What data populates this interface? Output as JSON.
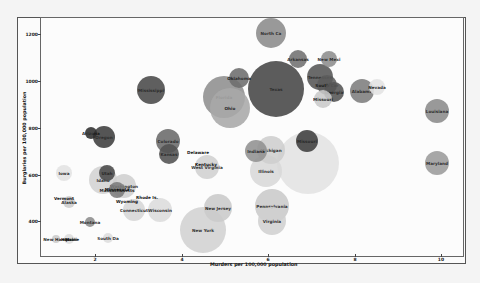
{
  "chart_data": {
    "type": "scatter",
    "subtype": "bubble",
    "title": "",
    "xlabel": "Murders per 100,000 population",
    "ylabel": "Burglaries per 100,000 population",
    "xlim": [
      0.8,
      10.3
    ],
    "ylim": [
      260,
      1300
    ],
    "x_ticks": [
      "2",
      "4",
      "6",
      "8",
      "10"
    ],
    "y_ticks": [
      "400",
      "600",
      "800",
      "1000",
      "1200"
    ],
    "grid": false,
    "legend": "none",
    "points": [
      {
        "label": "North Ca",
        "x": 6.6,
        "y": 1210,
        "r": 15,
        "color": "#8a8a8a"
      },
      {
        "label": "Arkansas",
        "x": 6.6,
        "y": 1095,
        "r": 9,
        "color": "#707070"
      },
      {
        "label": "New Mexi",
        "x": 7.3,
        "y": 1090,
        "r": 8,
        "color": "#8a8a8a"
      },
      {
        "label": "Oklahoma",
        "x": 5.4,
        "y": 1020,
        "r": 10,
        "color": "#6f6f6f"
      },
      {
        "label": "Texas",
        "x": 6.1,
        "y": 1000,
        "r": 27,
        "color": "#3c3c3c"
      },
      {
        "label": "California",
        "x": 6.2,
        "y": 960,
        "r": 0,
        "color": "#3c3c3c"
      },
      {
        "label": "Florida",
        "x": 5.2,
        "y": 955,
        "r": 21,
        "color": "#8f8f8f"
      },
      {
        "label": "Ohio",
        "x": 5.2,
        "y": 900,
        "r": 20,
        "color": "#a8a8a8"
      },
      {
        "label": "Tennessee",
        "x": 7.0,
        "y": 1030,
        "r": 13,
        "color": "#555555"
      },
      {
        "label": "South Car",
        "x": 7.1,
        "y": 1000,
        "r": 11,
        "color": "#5b5b5b"
      },
      {
        "label": "Georgia",
        "x": 7.4,
        "y": 970,
        "r": 10,
        "color": "#555555"
      },
      {
        "label": "Missouri",
        "x": 7.2,
        "y": 940,
        "r": 9,
        "color": "#c8c8c8"
      },
      {
        "label": "Alabama",
        "x": 8.1,
        "y": 960,
        "r": 12,
        "color": "#7c7c7c"
      },
      {
        "label": "Nevada",
        "x": 8.5,
        "y": 970,
        "r": 9,
        "color": "#e0e0e0"
      },
      {
        "label": "Louisiana",
        "x": 9.9,
        "y": 880,
        "r": 12,
        "color": "#8a8a8a"
      },
      {
        "label": "Maryland",
        "x": 9.9,
        "y": 640,
        "r": 12,
        "color": "#9a9a9a"
      },
      {
        "label": "Mississippi",
        "x": 3.3,
        "y": 960,
        "r": 14,
        "color": "#474747"
      },
      {
        "label": "Arizona",
        "x": 1.9,
        "y": 780,
        "r": 6,
        "color": "#2e2e2e"
      },
      {
        "label": "Oregon",
        "x": 2.2,
        "y": 770,
        "r": 11,
        "color": "#3d3d3d"
      },
      {
        "label": "Colorado",
        "x": 3.6,
        "y": 750,
        "r": 12,
        "color": "#6a6a6a"
      },
      {
        "label": "Kansas",
        "x": 3.6,
        "y": 690,
        "r": 10,
        "color": "#4e4e4e"
      },
      {
        "label": "Delaware",
        "x": 4.4,
        "y": 690,
        "r": 0,
        "color": "#cccccc"
      },
      {
        "label": "Kentucky",
        "x": 4.6,
        "y": 630,
        "r": 0,
        "color": "#cccccc"
      },
      {
        "label": "West Virginia",
        "x": 4.5,
        "y": 620,
        "r": 12,
        "color": "#d0d0d0"
      },
      {
        "label": "Indiana",
        "x": 5.7,
        "y": 700,
        "r": 10,
        "color": "#8f8f8f"
      },
      {
        "label": "Michigan",
        "x": 6.1,
        "y": 700,
        "r": 14,
        "color": "#cdcdcd"
      },
      {
        "label": "Illinois",
        "x": 5.9,
        "y": 620,
        "r": 16,
        "color": "#d8d8d8"
      },
      {
        "label": "Pennsylvania",
        "x": 6.0,
        "y": 450,
        "r": 17,
        "color": "#c9c9c9"
      },
      {
        "label": "Virginia",
        "x": 6.0,
        "y": 390,
        "r": 14,
        "color": "#cfcfcf"
      },
      {
        "label": "New Jersey",
        "x": 4.8,
        "y": 460,
        "r": 14,
        "color": "#c9c9c9"
      },
      {
        "label": "New York",
        "x": 4.4,
        "y": 350,
        "r": 22,
        "color": "#cfcfcf"
      },
      {
        "label": "Wisconsin",
        "x": 3.5,
        "y": 470,
        "r": 12,
        "color": "#dcdcdc"
      },
      {
        "label": "Connecticut",
        "x": 3.0,
        "y": 460,
        "r": 11,
        "color": "#d6d6d6"
      },
      {
        "label": "Nebraska",
        "x": 3.1,
        "y": 510,
        "r": 0,
        "color": "#cccccc"
      },
      {
        "label": "Wyoming",
        "x": 2.8,
        "y": 500,
        "r": 0,
        "color": "#cccccc"
      },
      {
        "label": "Washington",
        "x": 2.7,
        "y": 550,
        "r": 12,
        "color": "#cfcfcf"
      },
      {
        "label": "Massachusetts",
        "x": 2.5,
        "y": 555,
        "r": 8,
        "color": "#7a7a7a"
      },
      {
        "label": "Minnesota",
        "x": 2.2,
        "y": 565,
        "r": 0,
        "color": "#d0d0d0"
      },
      {
        "label": "Utah",
        "x": 2.3,
        "y": 610,
        "r": 8,
        "color": "#474747"
      },
      {
        "label": "Idaho",
        "x": 1.9,
        "y": 580,
        "r": 14,
        "color": "#d2d2d2"
      },
      {
        "label": "Iowa",
        "x": 1.2,
        "y": 610,
        "r": 7,
        "color": "#e3e3e3"
      },
      {
        "label": "Vermont",
        "x": 1.3,
        "y": 520,
        "r": 0,
        "color": "#d0d0d0"
      },
      {
        "label": "Alaska",
        "x": 1.5,
        "y": 505,
        "r": 6,
        "color": "#cccccc"
      },
      {
        "label": "Montana",
        "x": 1.8,
        "y": 395,
        "r": 5,
        "color": "#8a8a8a"
      },
      {
        "label": "South Da",
        "x": 2.3,
        "y": 335,
        "r": 5,
        "color": "#dddddd"
      },
      {
        "label": "Hawaii",
        "x": 1.5,
        "y": 330,
        "r": 5,
        "color": "#dddddd"
      },
      {
        "label": "New Hamp",
        "x": 1.2,
        "y": 325,
        "r": 0,
        "color": "#cccccc"
      },
      {
        "label": "Maine",
        "x": 1.0,
        "y": 320,
        "r": 0,
        "color": "#cccccc"
      },
      {
        "label": "Rhode Is.",
        "x": 3.0,
        "y": 520,
        "r": 0,
        "color": "#cccccc"
      },
      {
        "label": "",
        "x": 7.0,
        "y": 670,
        "r": 30,
        "color": "#e2e2e2"
      },
      {
        "label": "Missouri2",
        "x": 7.0,
        "y": 715,
        "r": 0,
        "color": "#3c3c3c"
      }
    ]
  },
  "axes": {
    "xlabel": "Murders per 100,000 population",
    "ylabel": "Burglaries per 100,000 population",
    "x_ticks": [
      "2",
      "4",
      "6",
      "8",
      "10"
    ],
    "y_ticks": [
      "400",
      "600",
      "800",
      "1000",
      "1200"
    ]
  },
  "bubbles": [
    {
      "label": "North Ca",
      "px": 271,
      "py": 33,
      "d": 30,
      "color": "#8c8c8c"
    },
    {
      "label": "Arkansas",
      "px": 298,
      "py": 59,
      "d": 18,
      "color": "#727272"
    },
    {
      "label": "New Mexi",
      "px": 329,
      "py": 59,
      "d": 16,
      "color": "#8e8e8e"
    },
    {
      "label": "Texas",
      "px": 276,
      "py": 89,
      "d": 56,
      "color": "#464646"
    },
    {
      "label": "Oklahoma",
      "px": 239,
      "py": 78,
      "d": 20,
      "color": "#6e6e6e"
    },
    {
      "label": "Florida",
      "px": 224,
      "py": 97,
      "d": 42,
      "color": "#8f8f8f"
    },
    {
      "label": "Ohio",
      "px": 230,
      "py": 108,
      "d": 40,
      "color": "#a9a9a9"
    },
    {
      "label": "Tennessee",
      "px": 320,
      "py": 77,
      "d": 26,
      "color": "#575757"
    },
    {
      "label": "South Car",
      "px": 327,
      "py": 85,
      "d": 20,
      "color": "#5c5c5c"
    },
    {
      "label": "Georgia",
      "px": 334,
      "py": 92,
      "d": 20,
      "color": "#555555"
    },
    {
      "label": "Missouri",
      "px": 323,
      "py": 99,
      "d": 18,
      "color": "#cacaca"
    },
    {
      "label": "Alabama",
      "px": 362,
      "py": 91,
      "d": 24,
      "color": "#7e7e7e"
    },
    {
      "label": "Nevada",
      "px": 377,
      "py": 87,
      "d": 16,
      "color": "#e4e4e4"
    },
    {
      "label": "Louisiana",
      "px": 437,
      "py": 111,
      "d": 24,
      "color": "#8c8c8c"
    },
    {
      "label": "Maryland",
      "px": 437,
      "py": 163,
      "d": 24,
      "color": "#9c9c9c"
    },
    {
      "label": "Mississippi",
      "px": 151,
      "py": 90,
      "d": 28,
      "color": "#4a4a4a"
    },
    {
      "label": "Arizona",
      "px": 91,
      "py": 133,
      "d": 12,
      "color": "#303030"
    },
    {
      "label": "Oregon",
      "px": 104,
      "py": 137,
      "d": 22,
      "color": "#3e3e3e"
    },
    {
      "label": "Colorado",
      "px": 168,
      "py": 141,
      "d": 24,
      "color": "#6b6b6b"
    },
    {
      "label": "Kansas",
      "px": 169,
      "py": 154,
      "d": 20,
      "color": "#525252"
    },
    {
      "label": "Delaware",
      "px": 198,
      "py": 152,
      "d": 0,
      "color": "#cccccc"
    },
    {
      "label": "Kentucky",
      "px": 206,
      "py": 164,
      "d": 0,
      "color": "#cccccc"
    },
    {
      "label": "West Virginia",
      "px": 207,
      "py": 167,
      "d": 24,
      "color": "#d1d1d1"
    },
    {
      "label": "",
      "px": 308,
      "py": 163,
      "d": 62,
      "color": "#e3e3e3"
    },
    {
      "label": "Missouri",
      "px": 307,
      "py": 141,
      "d": 22,
      "color": "#3f3f3f"
    },
    {
      "label": "Indiana",
      "px": 256,
      "py": 151,
      "d": 22,
      "color": "#929292"
    },
    {
      "label": "Michigan",
      "px": 271,
      "py": 150,
      "d": 28,
      "color": "#cfcfcf"
    },
    {
      "label": "Illinois",
      "px": 266,
      "py": 171,
      "d": 32,
      "color": "#d9d9d9"
    },
    {
      "label": "Pennsylvania",
      "px": 272,
      "py": 206,
      "d": 34,
      "color": "#cacaca"
    },
    {
      "label": "Virginia",
      "px": 272,
      "py": 221,
      "d": 28,
      "color": "#d1d1d1"
    },
    {
      "label": "New Jersey",
      "px": 218,
      "py": 208,
      "d": 28,
      "color": "#cbcbcb"
    },
    {
      "label": "New York",
      "px": 203,
      "py": 230,
      "d": 46,
      "color": "#d2d2d2"
    },
    {
      "label": "Wisconsin",
      "px": 160,
      "py": 210,
      "d": 24,
      "color": "#dddddd"
    },
    {
      "label": "Connecticut",
      "px": 134,
      "py": 210,
      "d": 22,
      "color": "#d7d7d7"
    },
    {
      "label": "Rhode Is.",
      "px": 147,
      "py": 197,
      "d": 0,
      "color": "#cccccc"
    },
    {
      "label": "Wyoming",
      "px": 127,
      "py": 201,
      "d": 0,
      "color": "#cccccc"
    },
    {
      "label": "Washington",
      "px": 124,
      "py": 186,
      "d": 24,
      "color": "#d0d0d0"
    },
    {
      "label": "Massachusetts",
      "px": 117,
      "py": 190,
      "d": 16,
      "color": "#7c7c7c"
    },
    {
      "label": "Minnesota",
      "px": 117,
      "py": 189,
      "d": 0,
      "color": "#d0d0d0"
    },
    {
      "label": "Utah",
      "px": 107,
      "py": 173,
      "d": 16,
      "color": "#4a4a4a"
    },
    {
      "label": "Idaho",
      "px": 103,
      "py": 180,
      "d": 28,
      "color": "#d4d4d4"
    },
    {
      "label": "Iowa",
      "px": 64,
      "py": 173,
      "d": 16,
      "color": "#e3e3e3"
    },
    {
      "label": "Vermont",
      "px": 64,
      "py": 198,
      "d": 0,
      "color": "#d0d0d0"
    },
    {
      "label": "Alaska",
      "px": 69,
      "py": 202,
      "d": 12,
      "color": "#cdcdcd"
    },
    {
      "label": "Montana",
      "px": 90,
      "py": 222,
      "d": 10,
      "color": "#8d8d8d"
    },
    {
      "label": "South Da",
      "px": 108,
      "py": 238,
      "d": 10,
      "color": "#dedede"
    },
    {
      "label": "Hawaii",
      "px": 69,
      "py": 239,
      "d": 10,
      "color": "#dedede"
    },
    {
      "label": "New Hamp",
      "px": 56,
      "py": 239,
      "d": 8,
      "color": "#cccccc"
    },
    {
      "label": "Maine",
      "px": 72,
      "py": 239,
      "d": 0,
      "color": "#cccccc"
    }
  ]
}
